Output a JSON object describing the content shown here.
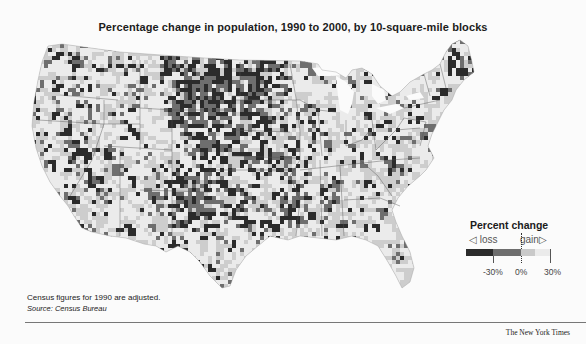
{
  "title": "Percentage change in population, 1990 to 2000, by 10-square-mile blocks",
  "legend": {
    "title": "Percent change",
    "loss_label": "◁ loss",
    "gain_label": "gain▷",
    "ticks": [
      "-30%",
      "0%",
      "30%"
    ],
    "colors": [
      "#2b2b2b",
      "#6e6e6e",
      "#c9c9c9",
      "#ebebeb"
    ]
  },
  "footnote": "Census figures for 1990 are adjusted.",
  "source": "Source: Census Bureau",
  "credit": "The New York Times",
  "chart_data": {
    "type": "heatmap",
    "title": "Percentage change in population, 1990 to 2000, by 10-square-mile blocks",
    "region": "Contiguous United States",
    "unit": "percent change",
    "scale": {
      "min": -30,
      "mid": 0,
      "max": 30,
      "tick_labels": [
        "-30%",
        "0%",
        "30%"
      ]
    },
    "color_classes": [
      {
        "range": "< -30%",
        "color": "#2b2b2b",
        "meaning": "heavy loss"
      },
      {
        "range": "-30% to 0%",
        "color": "#6e6e6e",
        "meaning": "loss"
      },
      {
        "range": "0% to 30%",
        "color": "#c9c9c9",
        "meaning": "gain"
      },
      {
        "range": "> 30%",
        "color": "#ebebeb",
        "meaning": "strong gain"
      }
    ],
    "notes": [
      "Census figures for 1990 are adjusted."
    ],
    "source": "Census Bureau",
    "observed_patterns": [
      "Heavy loss concentrated across Great Plains (Dakotas, Nebraska, Kansas, west Texas)",
      "Loss belt along Mississippi Delta and Appalachians",
      "Northern Maine shows loss",
      "Gains dominate Mountain West, Florida, Southeast, Great Lakes and Northeast corridor"
    ]
  }
}
